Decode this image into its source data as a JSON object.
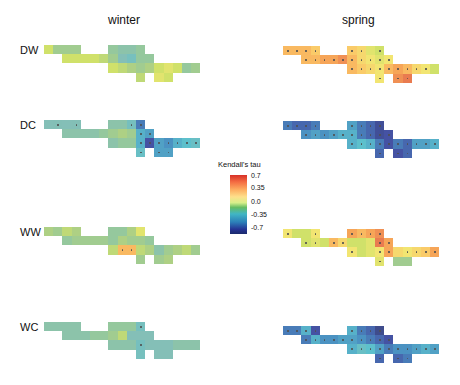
{
  "chart_data": {
    "type": "heatmap",
    "title": "",
    "columns": [
      "winter",
      "spring"
    ],
    "rows": [
      "DW",
      "DC",
      "WW",
      "WC"
    ],
    "legend": {
      "title": "Kendall's tau",
      "ticks": [
        "0.7",
        "0.35",
        "0.0",
        "-0.35",
        "-0.7"
      ],
      "range": [
        -0.7,
        0.7
      ]
    },
    "grid": {
      "cols": 17,
      "rows": 4
    },
    "mask": [
      [
        0,
        1,
        2,
        3,
        7,
        8,
        9,
        10
      ],
      [
        2,
        3,
        4,
        5,
        6,
        7,
        8,
        9,
        10,
        11
      ],
      [
        7,
        8,
        9,
        10,
        11,
        12,
        13,
        14,
        15,
        16
      ],
      [
        10,
        12,
        13
      ]
    ],
    "panels": {
      "DW_winter": {
        "values": [
          [
            0.2,
            0.05,
            0.05,
            0.05,
            0.0,
            -0.05,
            -0.05,
            0.0
          ],
          [
            0.2,
            0.2,
            0.2,
            0.2,
            0.15,
            0.05,
            -0.1,
            -0.15,
            0.0,
            0.0
          ],
          [
            0.2,
            0.15,
            0.1,
            0.05,
            0.1,
            0.2,
            0.25,
            0.2,
            0.0,
            0.05
          ],
          [
            0.15,
            0.25,
            0.2
          ]
        ],
        "sig": [
          [],
          [],
          [],
          []
        ]
      },
      "DW_spring": {
        "values": [
          [
            0.45,
            0.45,
            0.45,
            0.4,
            0.4,
            0.35,
            0.25,
            0.2
          ],
          [
            0.45,
            0.45,
            0.5,
            0.5,
            0.55,
            0.45,
            0.35,
            0.3,
            0.25,
            0.3
          ],
          [
            0.45,
            0.4,
            0.35,
            0.3,
            0.45,
            0.5,
            0.45,
            0.35,
            0.3,
            0.2
          ],
          [
            0.3,
            0.55,
            0.6
          ]
        ],
        "sig": [
          [
            0,
            1,
            2,
            3,
            7,
            8,
            10
          ],
          [
            2,
            3,
            4,
            5,
            6,
            7,
            8,
            9,
            10,
            11
          ],
          [
            7,
            8,
            9,
            10,
            11,
            12,
            13,
            14,
            15
          ],
          [
            10,
            12,
            13
          ]
        ]
      },
      "DW_winter_sig_note": "none",
      "DC_winter": {
        "values": [
          [
            -0.1,
            -0.1,
            -0.1,
            -0.1,
            -0.05,
            -0.05,
            -0.15,
            -0.45
          ],
          [
            -0.05,
            -0.05,
            -0.05,
            -0.05,
            0.0,
            0.05,
            0.1,
            0.05,
            -0.3,
            -0.35
          ],
          [
            -0.05,
            0.0,
            0.0,
            -0.3,
            -0.55,
            -0.35,
            -0.4,
            -0.3,
            -0.25,
            -0.2
          ],
          [
            -0.2,
            -0.35,
            -0.35
          ]
        ],
        "sig": [
          [
            1,
            3,
            9,
            10
          ],
          [
            10,
            11
          ],
          [
            10,
            11,
            12,
            13,
            14,
            15,
            16
          ],
          [
            10,
            12,
            13
          ]
        ]
      },
      "DC_spring": {
        "values": [
          [
            -0.45,
            -0.5,
            -0.5,
            -0.45,
            -0.35,
            -0.45,
            -0.5,
            -0.6
          ],
          [
            -0.4,
            -0.35,
            -0.4,
            -0.35,
            -0.3,
            -0.3,
            -0.45,
            -0.5,
            -0.6,
            -0.55
          ],
          [
            -0.3,
            -0.25,
            -0.3,
            -0.45,
            -0.55,
            -0.45,
            -0.5,
            -0.35,
            -0.35,
            -0.3
          ],
          [
            -0.5,
            -0.55,
            -0.5
          ]
        ],
        "sig": [
          [
            0,
            1,
            2,
            3,
            7,
            8,
            9,
            10
          ],
          [
            2,
            3,
            4,
            5,
            6,
            7,
            8,
            9,
            10,
            11
          ],
          [
            7,
            8,
            9,
            10,
            11,
            12,
            13,
            14,
            15,
            16
          ],
          [
            10,
            12,
            13
          ]
        ]
      },
      "WW_winter": {
        "values": [
          [
            0.1,
            0.05,
            0.15,
            0.1,
            0.0,
            0.0,
            0.1,
            0.25
          ],
          [
            0.0,
            0.05,
            0.05,
            0.05,
            0.05,
            0.0,
            0.1,
            0.05,
            0.05,
            0.0
          ],
          [
            0.15,
            0.45,
            0.45,
            0.15,
            0.1,
            -0.05,
            0.05,
            0.1,
            0.15,
            0.05
          ],
          [
            0.05,
            0.05,
            0.1
          ]
        ],
        "sig": [
          [],
          [],
          [
            8,
            9
          ],
          []
        ]
      },
      "WW_spring": {
        "values": [
          [
            0.3,
            0.2,
            0.2,
            0.3,
            0.5,
            0.45,
            0.5,
            0.55
          ],
          [
            0.2,
            0.25,
            0.2,
            0.45,
            0.35,
            0.2,
            0.2,
            0.25,
            0.6,
            0.5
          ],
          [
            0.3,
            0.2,
            0.25,
            0.3,
            0.5,
            0.35,
            0.3,
            0.35,
            0.4,
            0.5
          ],
          [
            0.25,
            0.05,
            0.05
          ]
        ],
        "sig": [
          [
            0,
            3,
            7,
            8,
            9,
            10
          ],
          [
            2,
            3,
            5,
            6,
            10,
            11
          ],
          [
            7,
            10,
            11,
            13,
            14,
            15,
            16
          ],
          [
            10
          ]
        ]
      },
      "WC_winter": {
        "values": [
          [
            -0.05,
            -0.05,
            -0.05,
            -0.05,
            0.0,
            0.0,
            0.0,
            -0.15
          ],
          [
            -0.05,
            -0.05,
            -0.05,
            0.0,
            0.0,
            0.05,
            0.15,
            -0.1,
            -0.1,
            -0.1
          ],
          [
            -0.05,
            -0.05,
            -0.05,
            -0.15,
            -0.1,
            -0.1,
            -0.1,
            -0.05,
            -0.05,
            -0.05
          ],
          [
            -0.15,
            -0.1,
            -0.1
          ]
        ],
        "sig": [
          [
            10
          ],
          [],
          [
            10
          ],
          []
        ]
      },
      "WC_spring": {
        "values": [
          [
            -0.45,
            -0.45,
            -0.3,
            -0.55,
            -0.3,
            -0.45,
            -0.5,
            -0.65
          ],
          [
            -0.45,
            -0.3,
            -0.4,
            -0.4,
            -0.35,
            -0.35,
            -0.4,
            -0.45,
            -0.5,
            -0.55
          ],
          [
            -0.3,
            -0.2,
            -0.25,
            -0.35,
            -0.45,
            -0.4,
            -0.4,
            -0.35,
            -0.3,
            -0.35
          ],
          [
            -0.5,
            -0.5,
            -0.45
          ]
        ],
        "sig": [
          [
            0,
            1,
            2,
            3,
            7,
            8,
            9,
            10
          ],
          [
            2,
            3,
            4,
            5,
            6,
            7,
            8,
            9,
            10,
            11
          ],
          [
            7,
            8,
            9,
            10,
            11,
            12,
            13,
            14,
            15,
            16
          ],
          [
            10,
            12,
            13
          ]
        ]
      }
    }
  },
  "labels": {
    "winter": "winter",
    "spring": "spring",
    "DW": "DW",
    "DC": "DC",
    "WW": "WW",
    "WC": "WC",
    "legend_title": "Kendall's tau",
    "tick_07": "0.7",
    "tick_035": "0.35",
    "tick_0": "0.0",
    "tick_m035": "-0.35",
    "tick_m07": "-0.7"
  }
}
